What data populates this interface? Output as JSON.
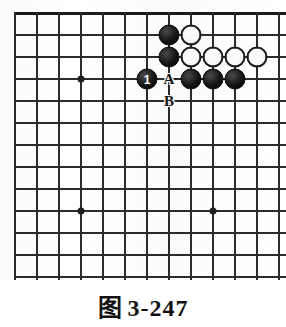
{
  "figure": {
    "caption_label": "图",
    "caption_number": "3-247",
    "caption_full": "图 3-247"
  },
  "board": {
    "type": "go-board-diagram",
    "visible_region": "top-right corner",
    "grid_spacing_px": 22,
    "grid": {
      "origin_x": 15,
      "origin_y": 13,
      "columns": 13,
      "rows": 12,
      "top_edge_row": 0,
      "bottom_cut_off": true,
      "right_cut_off": true
    },
    "colors": {
      "line": "#2b2b2b",
      "edge": "#1a1a1a",
      "black_stone": "#101010",
      "white_stone": "#ffffff",
      "background": "#ffffff"
    },
    "star_points": [
      {
        "col": 3,
        "row": 3
      },
      {
        "col": 3,
        "row": 9
      },
      {
        "col": 9,
        "row": 9
      }
    ],
    "stones": [
      {
        "color": "black",
        "col": 7,
        "row": 1,
        "label": ""
      },
      {
        "color": "white",
        "col": 8,
        "row": 1,
        "label": ""
      },
      {
        "color": "black",
        "col": 7,
        "row": 2,
        "label": ""
      },
      {
        "color": "white",
        "col": 8,
        "row": 2,
        "label": ""
      },
      {
        "color": "white",
        "col": 9,
        "row": 2,
        "label": ""
      },
      {
        "color": "white",
        "col": 10,
        "row": 2,
        "label": ""
      },
      {
        "color": "white",
        "col": 11,
        "row": 2,
        "label": ""
      },
      {
        "color": "black",
        "col": 6,
        "row": 3,
        "label": "1"
      },
      {
        "color": "black",
        "col": 8,
        "row": 3,
        "label": ""
      },
      {
        "color": "black",
        "col": 9,
        "row": 3,
        "label": ""
      },
      {
        "color": "black",
        "col": 10,
        "row": 3,
        "label": ""
      }
    ],
    "point_labels": [
      {
        "text": "A",
        "col": 7,
        "row": 3
      },
      {
        "text": "B",
        "col": 7,
        "row": 4
      }
    ]
  }
}
